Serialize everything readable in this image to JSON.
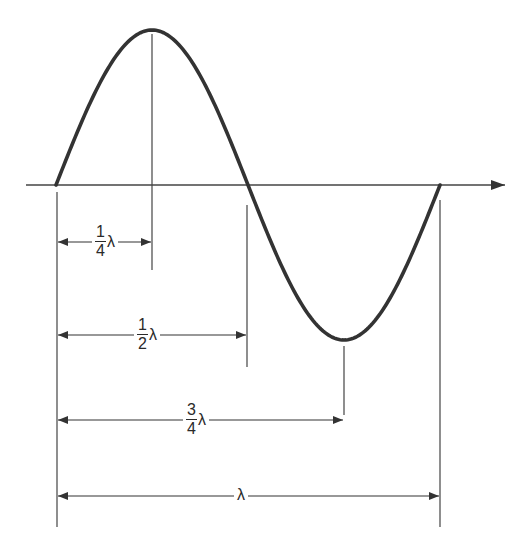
{
  "diagram": {
    "title": "",
    "type": "sine-wave-wavelength",
    "colors": {
      "wave": "#333333",
      "lines": "#444444",
      "background": "#ffffff"
    },
    "axis": {
      "y": 185,
      "x_start": 26,
      "x_end": 505,
      "arrow": "right"
    },
    "wave": {
      "x_start": 56,
      "x_end": 440,
      "center_y": 185,
      "amplitude": 155,
      "peak": {
        "x": 152,
        "y": 30
      },
      "zero_cross": {
        "x": 247,
        "y": 185
      },
      "trough": {
        "x": 344,
        "y": 340
      }
    },
    "dimensions": [
      {
        "id": "quarter",
        "numerator": "1",
        "denominator": "4",
        "symbol": "λ",
        "x_end": 152,
        "arrow_y": 242
      },
      {
        "id": "half",
        "numerator": "1",
        "denominator": "2",
        "symbol": "λ",
        "x_end": 247,
        "arrow_y": 335
      },
      {
        "id": "three-quarter",
        "numerator": "3",
        "denominator": "4",
        "symbol": "λ",
        "x_end": 344,
        "arrow_y": 420
      },
      {
        "id": "full",
        "numerator": "",
        "denominator": "",
        "symbol": "λ",
        "x_end": 440,
        "arrow_y": 496
      }
    ]
  }
}
